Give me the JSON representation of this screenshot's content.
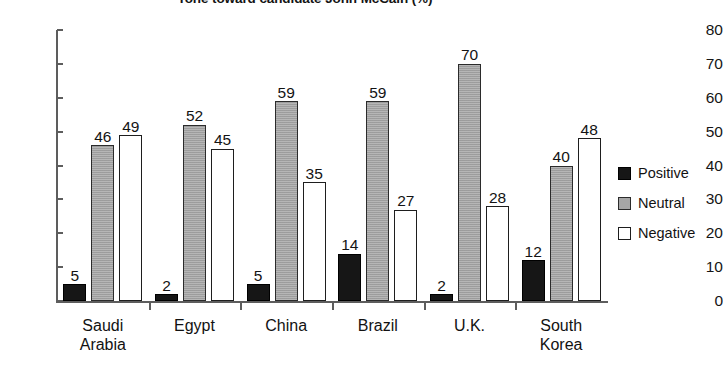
{
  "chart_data": {
    "type": "bar",
    "title": "Tone toward candidate John McCain (%)",
    "xlabel": "",
    "ylabel": "",
    "ylim": [
      0,
      80
    ],
    "ytick_step": 10,
    "yticks": [
      0,
      10,
      20,
      30,
      40,
      50,
      60,
      70,
      80
    ],
    "grid": false,
    "legend_position": "right",
    "value_labels": true,
    "categories": [
      "Saudi Arabia",
      "Egypt",
      "China",
      "Brazil",
      "U.K.",
      "South Korea"
    ],
    "category_lines": [
      [
        "Saudi",
        "Arabia"
      ],
      [
        "Egypt"
      ],
      [
        "China"
      ],
      [
        "Brazil"
      ],
      [
        "U.K."
      ],
      [
        "South",
        "Korea"
      ]
    ],
    "series": [
      {
        "name": "Positive",
        "color": "#161616",
        "values": [
          5,
          2,
          5,
          14,
          2,
          12
        ]
      },
      {
        "name": "Neutral",
        "color": "#a6a6a6",
        "values": [
          46,
          52,
          59,
          59,
          70,
          40
        ]
      },
      {
        "name": "Negative",
        "color": "#ffffff",
        "values": [
          49,
          45,
          35,
          27,
          28,
          48
        ]
      }
    ]
  },
  "legend": {
    "items": [
      {
        "label": "Positive",
        "swatch": "black-square-swatch"
      },
      {
        "label": "Neutral",
        "swatch": "gray-square-swatch"
      },
      {
        "label": "Negative",
        "swatch": "white-square-swatch"
      }
    ]
  },
  "axis": {
    "y_tick_labels": [
      "80",
      "70",
      "60",
      "50",
      "40",
      "30",
      "20",
      "10",
      "0"
    ]
  }
}
